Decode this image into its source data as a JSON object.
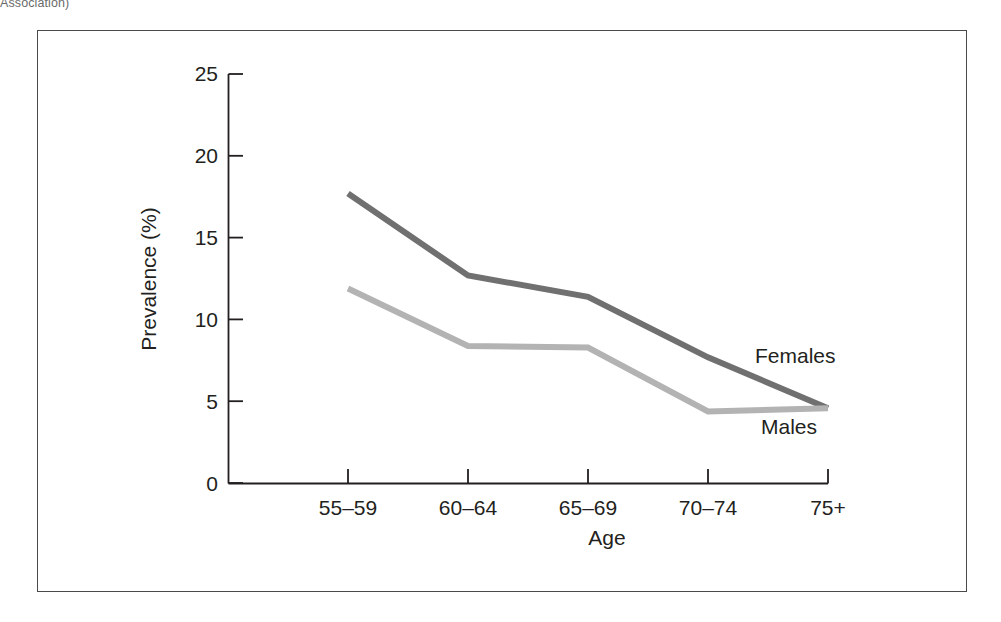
{
  "caption": {
    "partial_text": "Association)"
  },
  "figure": {
    "frame_border_color": "#4a4a4a",
    "background": "#ffffff"
  },
  "chart_data": {
    "type": "line",
    "title": "",
    "xlabel": "Age",
    "ylabel": "Prevalence (%)",
    "categories": [
      "55–59",
      "60–64",
      "65–69",
      "70–74",
      "75+"
    ],
    "series": [
      {
        "name": "Females",
        "color": "#707070",
        "values": [
          17.7,
          12.7,
          11.4,
          7.7,
          4.6
        ]
      },
      {
        "name": "Males",
        "color": "#b3b3b3",
        "values": [
          11.9,
          8.4,
          8.3,
          4.4,
          4.6
        ]
      }
    ],
    "ylim": [
      0,
      25
    ],
    "yticks": [
      0,
      5,
      10,
      15,
      20,
      25
    ],
    "ytick_labels": [
      "0",
      "5",
      "10",
      "15",
      "20",
      "25"
    ],
    "grid": false,
    "legend": "inline-annotations",
    "annotations": [
      {
        "text": "Females",
        "series": "Females"
      },
      {
        "text": "Males",
        "series": "Males"
      }
    ]
  }
}
